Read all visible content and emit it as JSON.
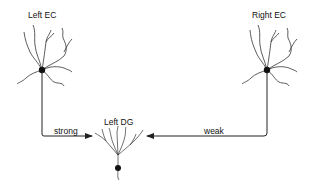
{
  "diagram": {
    "nodes": [
      {
        "id": "left_ec",
        "label": "Left EC"
      },
      {
        "id": "right_ec",
        "label": "Right EC"
      },
      {
        "id": "left_dg",
        "label": "Left DG"
      }
    ],
    "edges": [
      {
        "from": "left_ec",
        "to": "left_dg",
        "label": "strong"
      },
      {
        "from": "right_ec",
        "to": "left_dg",
        "label": "weak"
      }
    ]
  },
  "colors": {
    "line": "#222222",
    "soma": "#111111"
  }
}
